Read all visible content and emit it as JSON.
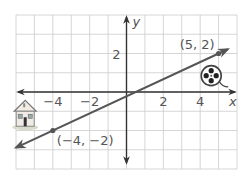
{
  "chart_data": {
    "type": "line",
    "title": "",
    "xlabel": "x",
    "ylabel": "y",
    "xlim": [
      -6,
      6
    ],
    "ylim": [
      -4,
      4
    ],
    "grid": true,
    "x_ticks": [
      {
        "value": -4,
        "label": "−4"
      },
      {
        "value": -2,
        "label": "−2"
      },
      {
        "value": 2,
        "label": "2"
      },
      {
        "value": 4,
        "label": "4"
      }
    ],
    "y_ticks": [
      {
        "value": 2,
        "label": "2"
      }
    ],
    "series": [
      {
        "name": "line",
        "points": [
          [
            -4,
            -2
          ],
          [
            5,
            2
          ]
        ],
        "extends_with_arrows": true,
        "extent_x": [
          -6,
          5.5
        ]
      }
    ],
    "points": [
      {
        "x": 5,
        "y": 2,
        "label": "(5, 2)"
      },
      {
        "x": -4,
        "y": -2,
        "label": "(−4, −2)"
      }
    ],
    "icons": [
      {
        "name": "house-icon",
        "near": "(-5, -1)"
      },
      {
        "name": "film-reel-icon",
        "near": "(4.5, 0.7)"
      }
    ],
    "colors": {
      "line": "#555555",
      "grid": "#cccccc",
      "axis": "#333333",
      "text": "#555555"
    }
  }
}
